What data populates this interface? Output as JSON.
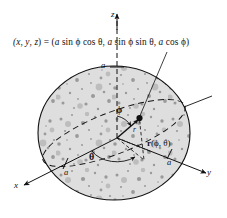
{
  "figure": {
    "type": "diagram",
    "background_color": "#ffffff",
    "ink_color": "#111111",
    "sphere_fill_color": "#d8d8d8",
    "equation": {
      "lhs": "(x, y, z) =",
      "rhs": "(a sin ϕ cos θ, a sin ϕ sin θ, a cos ϕ)",
      "full": "(x, y, z) = (a sin ϕ cos θ, a sin ϕ sin θ, a cos ϕ)"
    },
    "axes": [
      {
        "name": "z-axis",
        "label": "z",
        "direction": "up"
      },
      {
        "name": "y-axis",
        "label": "y",
        "direction": "lower-right"
      },
      {
        "name": "x-axis",
        "label": "x",
        "direction": "lower-left"
      }
    ],
    "radius_labels": [
      {
        "name": "radius-label-z",
        "label": "a",
        "axis": "z"
      },
      {
        "name": "radius-label-x",
        "label": "a",
        "axis": "x"
      },
      {
        "name": "radius-label-y",
        "label": "a",
        "axis": "y"
      }
    ],
    "angles": [
      {
        "name": "phi-angle",
        "label": "ϕ",
        "description": "polar angle from z-axis"
      },
      {
        "name": "theta-angle",
        "label": "θ",
        "description": "azimuthal angle in xy-plane from x-axis"
      }
    ],
    "vector": {
      "name": "position-vector",
      "label_bold": "r",
      "label_args": "(ϕ, θ)",
      "label_full": "r(ϕ, θ)",
      "short_label": "r"
    },
    "point": {
      "name": "surface-point",
      "description": "point on sphere surface at angles phi, theta"
    }
  }
}
